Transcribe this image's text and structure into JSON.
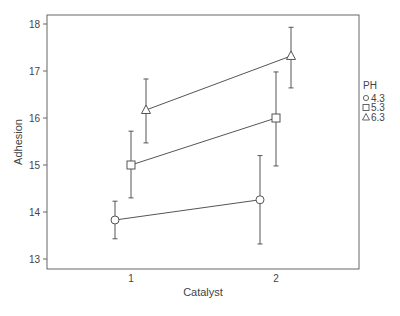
{
  "chart_data": {
    "type": "line",
    "title": "",
    "xlabel": "Catalyst",
    "ylabel": "Adhesion",
    "categories": [
      "1",
      "2"
    ],
    "ylim": [
      12.8,
      18.2
    ],
    "yticks": [
      13,
      14,
      15,
      16,
      17,
      18
    ],
    "grid": false,
    "legend": {
      "title": "PH",
      "position": "right",
      "entries": [
        {
          "label": "4.3",
          "marker": "circle"
        },
        {
          "label": "5.3",
          "marker": "square"
        },
        {
          "label": "6.3",
          "marker": "triangle"
        }
      ]
    },
    "series": [
      {
        "name": "4.3",
        "marker": "circle",
        "values": [
          13.83,
          14.26
        ],
        "error_upper": [
          14.23,
          15.2
        ],
        "error_lower": [
          13.43,
          13.32
        ]
      },
      {
        "name": "5.3",
        "marker": "square",
        "values": [
          15.0,
          16.0
        ],
        "error_upper": [
          15.72,
          16.98
        ],
        "error_lower": [
          14.3,
          14.98
        ]
      },
      {
        "name": "6.3",
        "marker": "triangle",
        "values": [
          16.17,
          17.32
        ],
        "error_upper": [
          16.83,
          17.93
        ],
        "error_lower": [
          15.47,
          16.64
        ]
      }
    ]
  },
  "colors": {
    "line": "#555555",
    "frame": "#666666",
    "text": "#444444"
  }
}
